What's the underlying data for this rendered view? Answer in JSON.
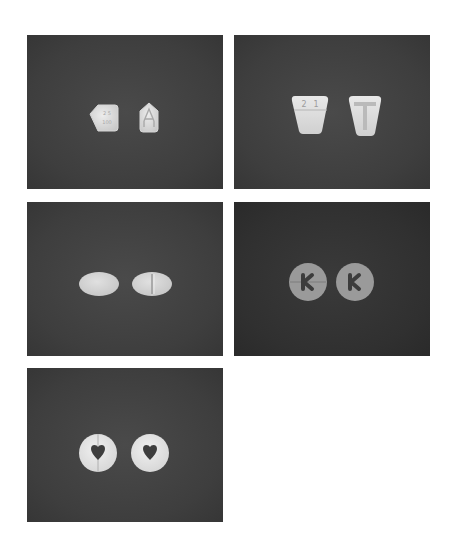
{
  "figure": {
    "colors": {
      "page_background": "#ffffff",
      "panel_background": "#414141",
      "panel_background_dark": "#303030",
      "tablet_light": "#e2e2e2",
      "tablet_gray": "#9a9a9a"
    },
    "panels": [
      {
        "id": 1,
        "tablets": [
          {
            "shape": "pentagon-left",
            "imprint": "engraved text (illegible)"
          },
          {
            "shape": "pentagon-up",
            "imprint": "house-shaped A logo"
          }
        ]
      },
      {
        "id": 2,
        "tablets": [
          {
            "shape": "trapezoid",
            "imprint": "2 1 with score line"
          },
          {
            "shape": "trapezoid",
            "imprint": "T"
          }
        ]
      },
      {
        "id": 3,
        "tablets": [
          {
            "shape": "oval",
            "imprint": "plain"
          },
          {
            "shape": "oval",
            "imprint": "bisect score line"
          }
        ]
      },
      {
        "id": 4,
        "tablets": [
          {
            "shape": "round",
            "imprint": "K with score line"
          },
          {
            "shape": "round",
            "imprint": "K"
          }
        ]
      },
      {
        "id": 5,
        "tablets": [
          {
            "shape": "round",
            "imprint": "heart cutout with score line"
          },
          {
            "shape": "round",
            "imprint": "heart cutout"
          }
        ]
      }
    ]
  }
}
